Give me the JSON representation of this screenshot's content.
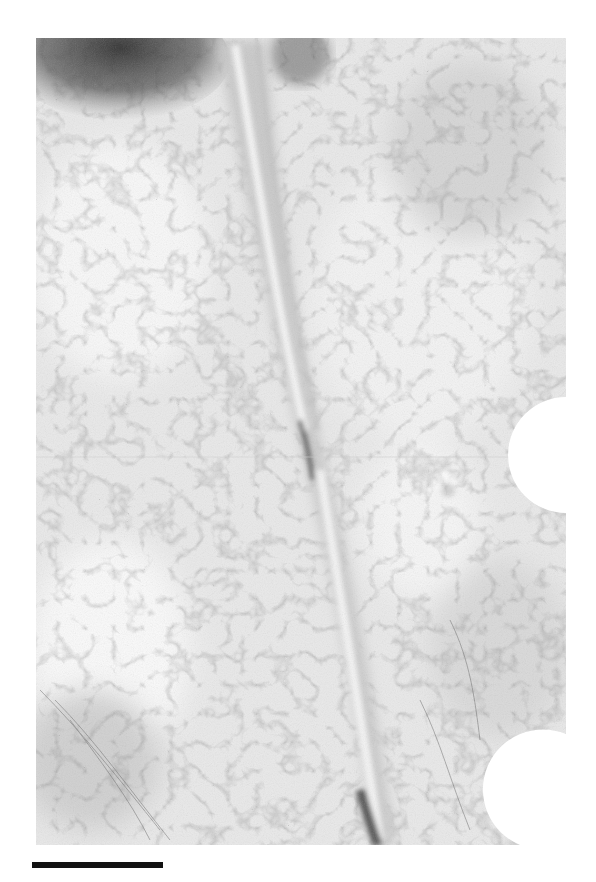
{
  "figure": {
    "image_region": {
      "x": 36,
      "y": 38,
      "width": 530,
      "height": 807
    },
    "colors": {
      "background": "#ffffff",
      "tissue_light": "#ececec",
      "tissue_mid": "#cfcfcf",
      "tissue_dark": "#3a3a3a",
      "scale_bar": "#111111"
    },
    "cutouts": [
      {
        "shape": "semicircle",
        "cx": 566,
        "cy": 455,
        "r": 58
      },
      {
        "shape": "circle",
        "cx": 548,
        "cy": 790,
        "r": 56
      }
    ],
    "scale_bar": {
      "x": 32,
      "y": 862,
      "width": 131,
      "height": 6,
      "label": ""
    }
  }
}
